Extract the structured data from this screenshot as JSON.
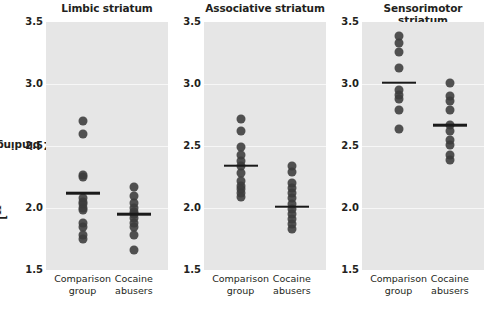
{
  "figure": {
    "ylabel_prefix": "[",
    "ylabel_sup": "11",
    "ylabel_rest": "C]DTBZ binding potential",
    "ylabel_full": "[11C]DTBZ binding potential",
    "background": "#e6e6e6",
    "dot_color": "#3b3b3b",
    "mean_color": "#1a1a1a",
    "gridline_color": "#f7f7f7"
  },
  "chart_data": {
    "type": "scatter",
    "title": "",
    "xlabel": "",
    "ylabel": "[11C]DTBZ binding potential",
    "ylim": [
      1.5,
      3.5
    ],
    "yticks": [
      "3.5",
      "3.0",
      "2.5",
      "2.0",
      "1.5"
    ],
    "ytick_values": [
      3.5,
      3.0,
      2.5,
      2.0,
      1.5
    ],
    "grid": true,
    "legend": "none",
    "group_labels": [
      "Comparison group",
      "Cocaine abusers"
    ],
    "panels": [
      {
        "title": "Limbic striatum",
        "groups": [
          {
            "name": "Comparison group",
            "label_line1": "Comparison",
            "label_line2": "group",
            "mean": 2.12,
            "values": [
              2.7,
              2.6,
              2.27,
              2.25,
              2.08,
              2.05,
              2.03,
              2.0,
              1.98,
              1.88,
              1.85,
              1.78,
              1.75
            ]
          },
          {
            "name": "Cocaine abusers",
            "label_line1": "Cocaine",
            "label_line2": "abusers",
            "mean": 1.95,
            "values": [
              2.17,
              2.1,
              2.04,
              2.0,
              1.97,
              1.95,
              1.92,
              1.88,
              1.85,
              1.78,
              1.66
            ]
          }
        ]
      },
      {
        "title": "Associative striatum",
        "groups": [
          {
            "name": "Comparison group",
            "label_line1": "Comparison",
            "label_line2": "group",
            "mean": 2.34,
            "values": [
              2.72,
              2.62,
              2.49,
              2.43,
              2.38,
              2.34,
              2.28,
              2.22,
              2.18,
              2.15,
              2.12,
              2.09
            ]
          },
          {
            "name": "Cocaine abusers",
            "label_line1": "Cocaine",
            "label_line2": "abusers",
            "mean": 2.01,
            "values": [
              2.34,
              2.29,
              2.2,
              2.16,
              2.12,
              2.08,
              2.03,
              1.99,
              1.95,
              1.91,
              1.87,
              1.83
            ]
          }
        ]
      },
      {
        "title": "Sensorimotor striatum",
        "groups": [
          {
            "name": "Comparison group",
            "label_line1": "Comparison",
            "label_line2": "group",
            "mean": 3.01,
            "values": [
              3.39,
              3.33,
              3.26,
              3.13,
              2.95,
              2.91,
              2.88,
              2.79,
              2.64
            ]
          },
          {
            "name": "Cocaine abusers",
            "label_line1": "Cocaine",
            "label_line2": "abusers",
            "mean": 2.67,
            "values": [
              3.01,
              2.9,
              2.86,
              2.79,
              2.67,
              2.62,
              2.55,
              2.51,
              2.43,
              2.39
            ]
          }
        ]
      }
    ]
  }
}
